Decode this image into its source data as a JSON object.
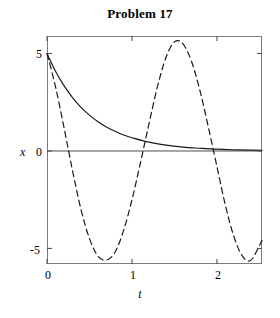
{
  "chart_data": {
    "type": "line",
    "title": "Problem 17",
    "xlabel": "t",
    "ylabel": "x",
    "xlim": [
      0,
      2.53
    ],
    "ylim": [
      -5.8,
      5.9
    ],
    "xticks": [
      0,
      1,
      2
    ],
    "xtick_labels": [
      "0",
      "1",
      "2"
    ],
    "yticks": [
      5,
      0,
      -5
    ],
    "ytick_labels": [
      "5",
      "0",
      "-5"
    ],
    "grid": false,
    "legend": null,
    "zero_line": 0,
    "series": [
      {
        "name": "solid-curve",
        "style": "solid",
        "color": "#000000",
        "description": "exponential decay from 5 toward 0",
        "x": [
          0,
          0.1,
          0.2,
          0.3,
          0.4,
          0.5,
          0.6,
          0.7,
          0.8,
          0.9,
          1.0,
          1.2,
          1.4,
          1.6,
          1.8,
          2.0,
          2.2,
          2.4,
          2.53
        ],
        "y": [
          5.0,
          4.09,
          3.35,
          2.74,
          2.24,
          1.84,
          1.5,
          1.23,
          1.01,
          0.82,
          0.68,
          0.45,
          0.3,
          0.2,
          0.14,
          0.09,
          0.06,
          0.04,
          0.03
        ]
      },
      {
        "name": "dashed-curve",
        "style": "dashed",
        "color": "#000000",
        "description": "oscillating curve starting at 5, amplitude about 5.6, period about 1.6",
        "x": [
          0,
          0.1,
          0.2,
          0.3,
          0.4,
          0.5,
          0.6,
          0.7,
          0.8,
          0.9,
          1.0,
          1.1,
          1.2,
          1.3,
          1.4,
          1.5,
          1.6,
          1.7,
          1.8,
          1.9,
          2.0,
          2.1,
          2.2,
          2.3,
          2.4,
          2.53
        ],
        "y": [
          5.0,
          3.3,
          1.2,
          -1.0,
          -3.0,
          -4.5,
          -5.4,
          -5.6,
          -5.2,
          -4.1,
          -2.5,
          -0.6,
          1.4,
          3.3,
          4.8,
          5.6,
          5.5,
          4.6,
          3.1,
          1.2,
          -0.8,
          -2.8,
          -4.4,
          -5.4,
          -5.6,
          -4.6
        ]
      }
    ]
  }
}
